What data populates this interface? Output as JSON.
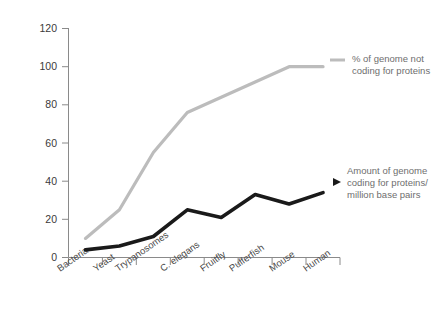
{
  "chart_data": {
    "type": "line",
    "title": "",
    "xlabel": "",
    "ylabel": "",
    "ylim": [
      0,
      120
    ],
    "ytick_step": 20,
    "yticks": [
      "0",
      "20",
      "40",
      "60",
      "80",
      "100",
      "120"
    ],
    "grid": false,
    "legend_position": "inline-annotation-right",
    "categories": [
      "Bacteria",
      "Yeast",
      "Trypanosomes",
      "C. elegans",
      "Fruitfly",
      "Pufferfish",
      "Mouse",
      "Human"
    ],
    "series": [
      {
        "name": "% of genome not coding for proteins",
        "color": "#bcbcbc",
        "values": [
          10,
          25,
          55,
          76,
          84,
          92,
          100,
          100
        ]
      },
      {
        "name": "Amount of genome coding for proteins/million base pairs",
        "color": "#1a1a1a",
        "values": [
          4,
          6,
          11,
          25,
          21,
          33,
          28,
          34
        ]
      }
    ],
    "annotations": [
      {
        "id": "gray-annotation",
        "lines": [
          "% of genome not",
          "coding for proteins"
        ],
        "target_series": "% of genome not coding for proteins",
        "marker": "dash"
      },
      {
        "id": "black-annotation",
        "lines": [
          "Amount of genome",
          "coding for proteins/",
          "million base pairs"
        ],
        "target_series": "Amount of genome coding for proteins/million base pairs",
        "marker": "arrow"
      }
    ]
  },
  "axis": {
    "y_tick_0": "0",
    "y_tick_20": "20",
    "y_tick_40": "40",
    "y_tick_60": "60",
    "y_tick_80": "80",
    "y_tick_100": "100",
    "y_tick_120": "120"
  },
  "categories": {
    "c0": "Bacteria",
    "c1": "Yeast",
    "c2": "Trypanosomes",
    "c3": "C. elegans",
    "c4": "Fruitfly",
    "c5": "Pufferfish",
    "c6": "Mouse",
    "c7": "Human"
  },
  "annotation_gray": {
    "line1": "% of genome not",
    "line2": "coding for proteins"
  },
  "annotation_black": {
    "line1": "Amount of genome",
    "line2": "coding for proteins/",
    "line3": "million base pairs"
  },
  "colors": {
    "gray_series": "#bcbcbc",
    "black_series": "#1a1a1a",
    "axis": "#8a8a8a",
    "label": "#4a4a4a",
    "annotation": "#6e6e6e",
    "background": "#ffffff"
  }
}
